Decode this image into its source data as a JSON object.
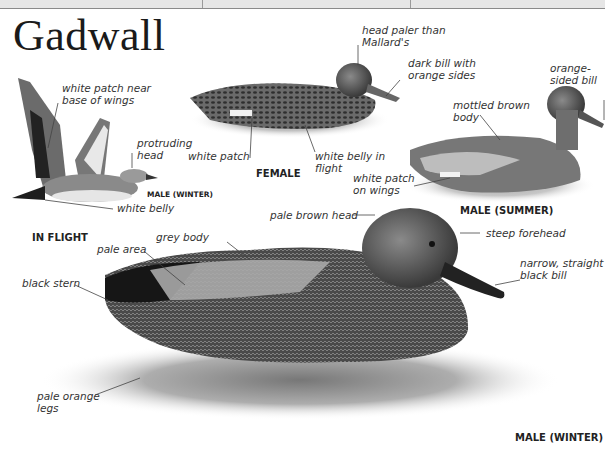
{
  "page": {
    "title": "Gadwall",
    "header_bar": {
      "dividers_x": [
        202,
        410
      ]
    }
  },
  "figures": {
    "in_flight": {
      "caption": "IN FLIGHT",
      "sub_caption": "MALE (WINTER)",
      "labels": {
        "white_patch": "white patch near\nbase of wings",
        "protruding_head": "protruding\nhead",
        "white_belly": "white belly"
      }
    },
    "female": {
      "caption": "FEMALE",
      "labels": {
        "head_paler": "head paler than\nMallard's",
        "dark_bill": "dark bill with\norange sides",
        "white_patch": "white patch",
        "white_belly": "white belly in\nflight"
      }
    },
    "male_summer": {
      "caption": "MALE (SUMMER)",
      "labels": {
        "orange_bill": "orange-\nsided bill",
        "mottled_body": "mottled brown\nbody",
        "white_patch_wings": "white patch\non wings"
      }
    },
    "male_winter": {
      "caption": "MALE (WINTER)",
      "labels": {
        "pale_brown_head": "pale brown head",
        "steep_forehead": "steep forehead",
        "bill": "narrow, straight\nblack bill",
        "grey_body": "grey body",
        "pale_area": "pale area",
        "black_stern": "black stern",
        "legs": "pale orange\nlegs"
      }
    }
  },
  "colors": {
    "ink": "#1a1a1a",
    "label": "#333333",
    "header_bg": "#e6e6e6"
  }
}
